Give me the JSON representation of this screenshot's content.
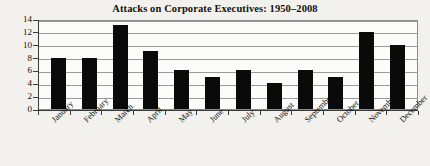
{
  "chart_data": {
    "type": "bar",
    "title": "Attacks on Corporate Executives: 1950–2008",
    "xlabel": "",
    "ylabel": "",
    "ylim": [
      0,
      14
    ],
    "ytick_step": 2,
    "yticks": [
      14,
      12,
      10,
      8,
      6,
      4,
      2,
      0
    ],
    "grid": true,
    "grid_axis": "y",
    "legend": false,
    "legend_position": "none",
    "bar_color": "#0a0a0a",
    "categories": [
      "January",
      "February",
      "March",
      "April",
      "May",
      "June",
      "July",
      "August",
      "September",
      "October",
      "November",
      "December"
    ],
    "values": [
      8,
      8,
      13,
      9,
      6,
      5,
      6,
      4,
      6,
      5,
      12,
      10
    ],
    "xtick_labels_rotated": true,
    "xtick_rotation_degrees": -45
  },
  "figure": {
    "background_color": "#f2f1ee",
    "plot_background_color": "#fbfbfa",
    "axis_color": "#3a3a3a",
    "grid_color": "#9a9a9a"
  }
}
